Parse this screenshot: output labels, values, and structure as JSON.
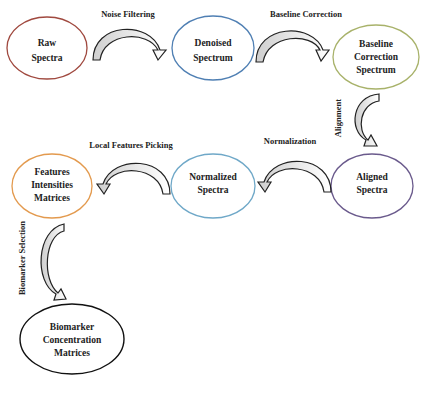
{
  "diagram": {
    "type": "flowchart",
    "nodes": [
      {
        "id": "raw",
        "lines": [
          "Raw",
          "Spectra"
        ],
        "color": "#a0493f"
      },
      {
        "id": "denoised",
        "lines": [
          "Denoised",
          "Spectrum"
        ],
        "color": "#4f7fb3"
      },
      {
        "id": "baseline",
        "lines": [
          "Baseline",
          "Correction",
          "Spectrum"
        ],
        "color": "#a8b26a"
      },
      {
        "id": "aligned",
        "lines": [
          "Aligned",
          "Spectra"
        ],
        "color": "#6a5a8c"
      },
      {
        "id": "normalized",
        "lines": [
          "Normalized",
          "Spectra"
        ],
        "color": "#6fa8c8"
      },
      {
        "id": "features",
        "lines": [
          "Features",
          "Intensities",
          "Matrices"
        ],
        "color": "#e39a4e"
      },
      {
        "id": "biomarker",
        "lines": [
          "Biomarker",
          "Concentration",
          "Matrices"
        ],
        "color": "#111111"
      }
    ],
    "steps": [
      {
        "from": "raw",
        "to": "denoised",
        "label": "Noise Filtering"
      },
      {
        "from": "denoised",
        "to": "baseline",
        "label": "Baseline Correction"
      },
      {
        "from": "baseline",
        "to": "aligned",
        "label": "Alignment"
      },
      {
        "from": "aligned",
        "to": "normalized",
        "label": "Normalization"
      },
      {
        "from": "normalized",
        "to": "features",
        "label": "Local Features Picking"
      },
      {
        "from": "features",
        "to": "biomarker",
        "label": "Biomarker Selection"
      }
    ]
  }
}
